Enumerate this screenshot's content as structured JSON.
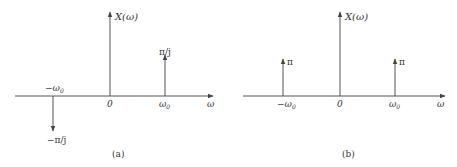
{
  "figure": {
    "panels": [
      {
        "id": "a",
        "caption": "(a)",
        "y_axis_label": "X(ω)",
        "x_axis_label": "ω",
        "origin_label": "0",
        "ticks": {
          "neg_w0": "−ω",
          "neg_w0_sub": "0",
          "pos_w0": "ω",
          "pos_w0_sub": "0"
        },
        "impulses": [
          {
            "position": "−ω0",
            "label": "−π/j",
            "direction": "down"
          },
          {
            "position": "ω0",
            "label": "π/j",
            "direction": "up"
          }
        ]
      },
      {
        "id": "b",
        "caption": "(b)",
        "y_axis_label": "X(ω)",
        "x_axis_label": "ω",
        "origin_label": "0",
        "ticks": {
          "neg_w0": "−ω",
          "neg_w0_sub": "0",
          "pos_w0": "ω",
          "pos_w0_sub": "0"
        },
        "impulses": [
          {
            "position": "−ω0",
            "label": "π",
            "direction": "up"
          },
          {
            "position": "ω0",
            "label": "π",
            "direction": "up"
          }
        ]
      }
    ],
    "colors": {
      "line": "#555555",
      "text": "#333333",
      "background": "#ffffff"
    }
  }
}
